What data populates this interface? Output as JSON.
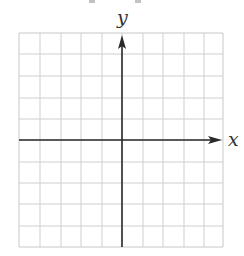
{
  "diagram": {
    "type": "coordinate-plane",
    "grid": {
      "columns": 10,
      "rows": 10,
      "x_lines": [
        19,
        40,
        61,
        81,
        102,
        122,
        143,
        163,
        184,
        204,
        223
      ],
      "y_lines": [
        33,
        54,
        76,
        98,
        119,
        140,
        162,
        183,
        204,
        226,
        247
      ],
      "line_color": "#cfcfcf",
      "border_color": "#c8c8c8"
    },
    "axes": {
      "color": "#2a2a2a",
      "x_axis": {
        "label": "x",
        "y": 140,
        "from": 19,
        "to": 222
      },
      "y_axis": {
        "label": "y",
        "x": 122,
        "from": 247,
        "to": 35
      }
    }
  }
}
